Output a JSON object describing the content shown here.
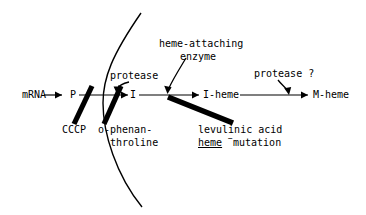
{
  "diagram": {
    "background_color": "#ffffff",
    "stroke_color": "#000000",
    "nodes": [
      {
        "id": "mrna",
        "label": "mRNA",
        "x": 22,
        "y": 98
      },
      {
        "id": "p",
        "label": "P",
        "x": 72,
        "y": 98
      },
      {
        "id": "i",
        "label": "I",
        "x": 133,
        "y": 98
      },
      {
        "id": "iheme",
        "label": "I-heme",
        "x": 205,
        "y": 98
      },
      {
        "id": "mheme",
        "label": "M-heme",
        "x": 315,
        "y": 98
      }
    ],
    "enzymes": [
      {
        "id": "protease-1",
        "label": "protease",
        "x": 110,
        "y": 78
      },
      {
        "id": "heme-attaching-enzyme",
        "line1": "heme-attaching",
        "line2": "enzyme",
        "x": 160,
        "y": 46
      },
      {
        "id": "protease-2",
        "label": "protease ?",
        "x": 256,
        "y": 76
      }
    ],
    "inhibitors": [
      {
        "id": "cccp",
        "label": "CCCP",
        "x": 62,
        "y": 131
      },
      {
        "id": "o-phenanthroline",
        "line1": "o-phenan-",
        "line2": "throline",
        "x": 99,
        "y": 131
      },
      {
        "id": "levulinic",
        "line1": "levulinic acid",
        "line2_a": "heme",
        "line2_sup": "−",
        "line2_b": " mutation",
        "x": 198,
        "y": 131
      }
    ],
    "membrane": {
      "id": "membrane-arc",
      "description": "cell membrane boundary arc"
    }
  }
}
